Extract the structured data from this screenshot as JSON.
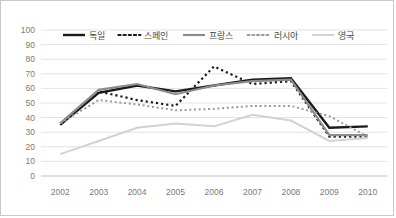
{
  "chart_data": {
    "type": "line",
    "title": "",
    "xlabel": "",
    "ylabel": "",
    "categories": [
      "2002",
      "2003",
      "2004",
      "2005",
      "2006",
      "2007",
      "2008",
      "2009",
      "2010"
    ],
    "ylim": [
      0,
      100
    ],
    "ytick_step": 10,
    "yticks": [
      "100",
      "90",
      "80",
      "70",
      "60",
      "50",
      "40",
      "30",
      "20",
      "10",
      "0"
    ],
    "grid": true,
    "legend_position": "top",
    "series": [
      {
        "name": "독일",
        "values": [
          35,
          57,
          62,
          58,
          62,
          66,
          67,
          33,
          34
        ],
        "style": "solid",
        "color": "#1a1a1a",
        "width": 2.4
      },
      {
        "name": "스페인",
        "values": [
          36,
          58,
          52,
          48,
          75,
          63,
          65,
          27,
          27
        ],
        "style": "dotted",
        "color": "#1a1a1a",
        "width": 2.2
      },
      {
        "name": "프랑스",
        "values": [
          36,
          59,
          63,
          56,
          62,
          65,
          66,
          28,
          28
        ],
        "style": "solid",
        "color": "#8c8c8c",
        "width": 2.2
      },
      {
        "name": "러시아",
        "values": [
          36,
          52,
          49,
          45,
          46,
          48,
          48,
          41,
          27
        ],
        "style": "dotted",
        "color": "#9a9a9a",
        "width": 2.0
      },
      {
        "name": "영국",
        "values": [
          15,
          24,
          33,
          36,
          34,
          42,
          38,
          24,
          26
        ],
        "style": "solid",
        "color": "#d2d2d2",
        "width": 2.0
      }
    ]
  },
  "colors": {
    "grid": "#e2e2e2",
    "frame": "#c9c9c9",
    "tick_text": "#7a7a7a",
    "legend_text": "#4a4a4a",
    "background": "#ffffff"
  }
}
